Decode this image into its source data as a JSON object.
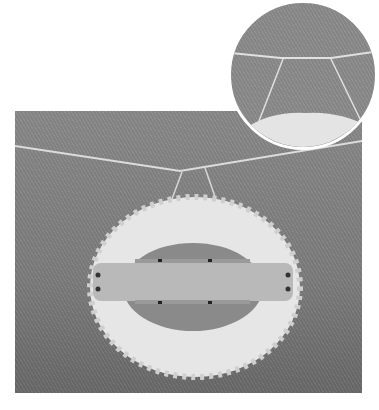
{
  "image": {
    "description": "Grayscale photo of a white fluffy yarn ring (pom-pom maker) hanging from a taut string on a gray background, with a circular magnified inset at top right showing the string attachment",
    "colors": {
      "background": "#ffffff",
      "photo_gray": "#808080",
      "yarn": "#e8e8e8",
      "inset_border": "#ffffff"
    },
    "caption": ""
  }
}
